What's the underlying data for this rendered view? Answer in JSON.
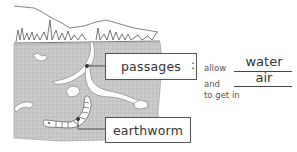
{
  "diagram": {
    "labels": {
      "passages": "passages",
      "earthworm": "earthworm"
    },
    "sentence": {
      "colon": ":",
      "allow": "allow",
      "blank1_answer": "water",
      "and": "and",
      "blank2_answer": "air",
      "to_get_in": "to get in"
    },
    "colors": {
      "soil": "#c9c9c9",
      "line": "#444444",
      "background": "#ffffff"
    }
  }
}
